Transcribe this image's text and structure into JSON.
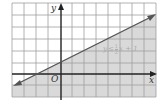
{
  "figure": {
    "type": "inequality-graph",
    "inequality": {
      "lhs": "y",
      "op": "≤",
      "frac_num": "1",
      "frac_den": "2",
      "rest": "x + 1"
    },
    "axes": {
      "x_label": "x",
      "y_label": "y",
      "origin_label": "O"
    },
    "boundary": {
      "slope": 0.5,
      "intercept": 1,
      "style": "solid",
      "arrows": "both"
    },
    "shading": "below",
    "colors": {
      "shade": "#d9d9d9",
      "grid": "#9a9a9a",
      "axis": "#222222",
      "line": "#555555",
      "label_text": "#aaaaaa"
    }
  }
}
